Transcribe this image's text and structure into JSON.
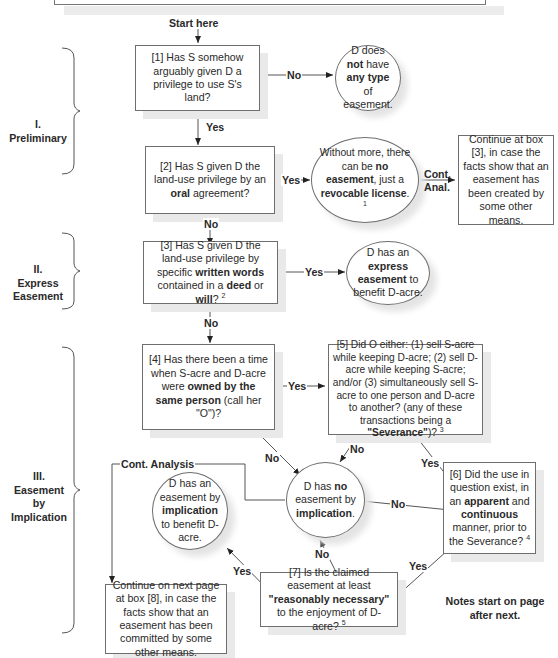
{
  "start_label": "Start here",
  "sections": [
    {
      "numeral": "I.",
      "title": "Preliminary"
    },
    {
      "numeral": "II.",
      "title": "Express Easement"
    },
    {
      "numeral": "III.",
      "title": "Easement by Implication"
    }
  ],
  "boxes": {
    "b1": {
      "pre": "[1] Has S somehow arguably given D a privilege to use S's land?"
    },
    "b2": {
      "pre": "[2] Has S given D the land-use privilege by an ",
      "bold1": "oral",
      "post": " agreement?"
    },
    "b2_continue": {
      "text": "Continue at box [3], in case the facts show that an easement has been created by some other means."
    },
    "b3": {
      "pre": "[3] Has S given D the land-use privilege by specific ",
      "bold1": "written words",
      "mid": " contained in a ",
      "bold2": "deed",
      "mid2": " or ",
      "bold3": "will",
      "post": "? ",
      "note": "2"
    },
    "b4": {
      "pre": "[4] Has there been a time when S-acre and D-acre were ",
      "bold1": "owned by the same person",
      "post": " (call her \"O\")?"
    },
    "b5": {
      "pre": "[5] Did O either: (1) sell S-acre while keeping D-acre; (2) sell D-acre while keeping S-acre; and/or (3) simultaneously sell S-acre to one person and D-acre to another? (any of these transactions being a ",
      "bold1": "\"Severance\"",
      "post": ")? ",
      "note": "3"
    },
    "b6": {
      "pre": "[6] Did the use in question exist, in an ",
      "bold1": "apparent",
      "mid": " and ",
      "bold2": "continuous",
      "post": " manner, prior to the Severance? ",
      "note": "4"
    },
    "b7": {
      "pre": "[7] Is the claimed easement at least ",
      "bold1": "\"reasonably necessary\"",
      "post": " to the enjoyment of D-acre? ",
      "note": "5"
    },
    "b8_continue": {
      "text": "Continue on next page at box [8], in case the facts show that an easement has been committed by some other means."
    }
  },
  "circles": {
    "c1": {
      "pre": "D does ",
      "bold1": "not",
      "mid": " have ",
      "bold2": "any type",
      "post": " of easement."
    },
    "c2": {
      "pre": "Without more, there can be ",
      "bold1": "no easement",
      "mid": ", just a ",
      "bold2": "revocable license",
      "post": ". ",
      "note": "1"
    },
    "c3": {
      "pre": "D has an ",
      "bold1": "express easement",
      "post": " to benefit D-acre."
    },
    "c4": {
      "pre": "D has ",
      "bold1": "no",
      "mid": " easement by ",
      "bold2": "implication",
      "post": "."
    },
    "c5": {
      "pre": "D has an easement by ",
      "bold1": "implication",
      "post": " to benefit D-acre."
    }
  },
  "edge_labels": {
    "b1_no": "No",
    "b1_yes": "Yes",
    "b2_yes": "Yes",
    "b2_no": "No",
    "c2_cont": "Cont. Anal.",
    "b3_yes": "Yes",
    "b3_no": "No",
    "b4_yes": "Yes",
    "b4_no": "No",
    "b5_no": "No",
    "b5_yes": "Yes",
    "b6_no": "No",
    "b6_yes": "Yes",
    "b7_no": "No",
    "b7_yes": "Yes",
    "c4_cont": "Cont. Analysis"
  },
  "footer_note": "Notes start on page after next."
}
